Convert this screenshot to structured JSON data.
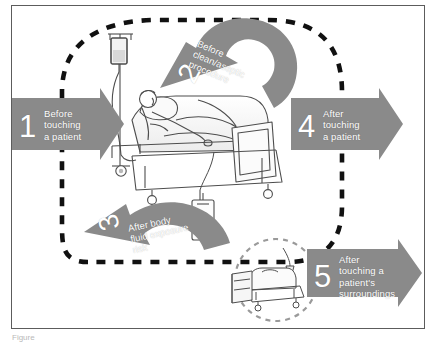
{
  "figure": {
    "bottom_caption": "Figure",
    "frame_color": "#5c5c5c",
    "arrow_color": "#8a8a8a",
    "arrow_text_color": "#ffffff",
    "dashed_loop_color": "#000000",
    "line_art_color": "#4d4d4d"
  },
  "moments": [
    {
      "number": "1",
      "label": "Before\ntouching\na patient",
      "shape": "straight-right-arrow",
      "position": "left"
    },
    {
      "number": "2",
      "label": "Before\nclean/aseptic\nprocedure",
      "shape": "curved-arrow",
      "position": "top-center"
    },
    {
      "number": "3",
      "label": "After body\nfluid exposure\nrisk",
      "shape": "curved-arrow",
      "position": "bottom-center-left"
    },
    {
      "number": "4",
      "label": "After\ntouching\na patient",
      "shape": "straight-right-arrow",
      "position": "right"
    },
    {
      "number": "5",
      "label": "After\ntouching a\npatient's\nsurroundings",
      "shape": "straight-right-arrow",
      "position": "bottom-right"
    }
  ],
  "illustrations": [
    {
      "name": "hospital-bed-with-patient",
      "description": "Patient reclining in a hospital bed with raised headrest, pillow and blanket"
    },
    {
      "name": "iv-drip-stand",
      "description": "Intravenous drip bag hanging on a wheeled pole at the head of the bed"
    },
    {
      "name": "urine-drainage-bag",
      "description": "Fluid drainage bag hanging from the bed frame"
    },
    {
      "name": "empty-bed-in-circle",
      "description": "Empty bed with bedside cabinet and lamp inside a dashed circle, representing patient surroundings"
    }
  ]
}
